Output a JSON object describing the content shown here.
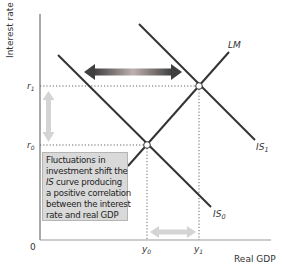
{
  "diagram": {
    "type": "IS-LM shift diagram",
    "y_axis_label": "Interest rate",
    "x_axis_label": "Real GDP",
    "origin_label": "0",
    "y_ticks": [
      {
        "label": "r",
        "sub": "1"
      },
      {
        "label": "r",
        "sub": "0"
      }
    ],
    "x_ticks": [
      {
        "label": "y",
        "sub": "0"
      },
      {
        "label": "y",
        "sub": "1"
      }
    ],
    "curves": {
      "lm": {
        "label": "LM",
        "sub": ""
      },
      "is0": {
        "label": "IS",
        "sub": "0"
      },
      "is1": {
        "label": "IS",
        "sub": "1"
      }
    },
    "callout": {
      "lines": [
        "Fluctuations in",
        "investment shift the",
        " curve producing",
        "a positive correlation",
        "between the interest",
        "rate and real GDP"
      ],
      "italic_prefix": "IS"
    },
    "colors": {
      "curve": "#333333",
      "axis": "#555555",
      "callout_bg": "#d9d9d9",
      "arrow_light": "#d4d4d4",
      "arrow_dark": "#4a4a4a",
      "arrow_mid": "#b8a8a8"
    }
  }
}
